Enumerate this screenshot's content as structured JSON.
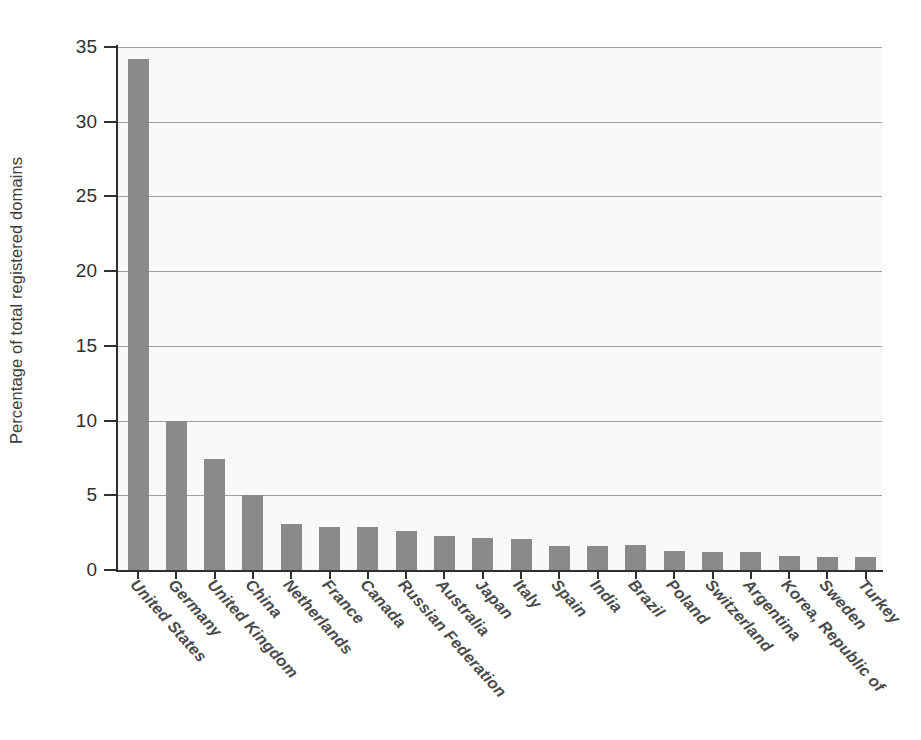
{
  "chart_data": {
    "type": "bar",
    "title": "",
    "subtitle": "",
    "xlabel": "",
    "ylabel": "Percentage of total registered domains",
    "ylim": [
      0,
      35
    ],
    "yticks": [
      0,
      5,
      10,
      15,
      20,
      25,
      30,
      35
    ],
    "ytick_labels": [
      "0",
      "5",
      "10",
      "15",
      "20",
      "25",
      "30",
      "35"
    ],
    "grid": true,
    "grid_axis": "y",
    "legend": false,
    "legend_position": "none",
    "bar_color": "#8a8a8a",
    "plot_background": "#f8f8f8",
    "axis_color": "#2f2f2f",
    "gridline_color": "#9e9e9e",
    "categories": [
      "United States",
      "Germany",
      "United Kingdom",
      "China",
      "Netherlands",
      "France",
      "Canada",
      "Russian Federation",
      "Australia",
      "Japan",
      "Italy",
      "Spain",
      "India",
      "Brazil",
      "Poland",
      "Switzerland",
      "Argentina",
      "Korea, Republic of",
      "Sweden",
      "Turkey"
    ],
    "values": [
      34.2,
      9.95,
      7.4,
      5.0,
      3.1,
      2.9,
      2.9,
      2.6,
      2.3,
      2.15,
      2.05,
      1.6,
      1.6,
      1.65,
      1.3,
      1.2,
      1.2,
      0.95,
      0.85,
      0.9
    ]
  }
}
